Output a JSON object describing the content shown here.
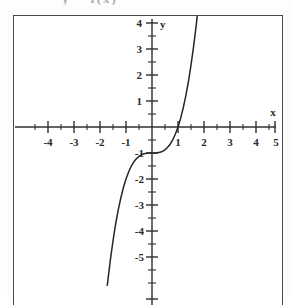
{
  "caption": {
    "fragment_text": "y = f(x)"
  },
  "chart_data": {
    "type": "line",
    "title": "",
    "subtitle": "",
    "xlabel": "x",
    "ylabel": "y",
    "function_label": "y = x^3 - 1",
    "xlim": [
      -5,
      5
    ],
    "ylim": [
      -6,
      4.3
    ],
    "grid": false,
    "legend": "none",
    "axis_style": "centered-cross",
    "x_tick_labels": [
      "-4",
      "-3",
      "-2",
      "-1",
      "1",
      "2",
      "3",
      "4",
      "5"
    ],
    "x_tick_values": [
      -4,
      -3,
      -2,
      -1,
      1,
      2,
      3,
      4,
      5
    ],
    "y_tick_labels": [
      "4",
      "3",
      "2",
      "1",
      "-1",
      "-2",
      "-3",
      "-4",
      "-5"
    ],
    "y_tick_values": [
      4,
      3,
      2,
      1,
      -1,
      -2,
      -3,
      -4,
      -5
    ],
    "minor_tick_step": 0.5,
    "series": [
      {
        "name": "y = x^3 - 1",
        "x": [
          -1.72,
          -1.6,
          -1.5,
          -1.4,
          -1.3,
          -1.2,
          -1.1,
          -1.0,
          -0.9,
          -0.8,
          -0.7,
          -0.6,
          -0.5,
          -0.4,
          -0.3,
          -0.2,
          -0.1,
          0.0,
          0.1,
          0.2,
          0.3,
          0.4,
          0.5,
          0.6,
          0.7,
          0.8,
          0.9,
          1.0,
          1.1,
          1.2,
          1.3,
          1.4,
          1.5,
          1.6,
          1.7,
          1.74
        ],
        "y": [
          -6.09,
          -5.1,
          -4.38,
          -3.74,
          -3.2,
          -2.73,
          -2.33,
          -2.0,
          -1.73,
          -1.51,
          -1.34,
          -1.22,
          -1.13,
          -1.06,
          -1.03,
          -1.01,
          -1.0,
          -1.0,
          -1.0,
          -0.99,
          -0.97,
          -0.94,
          -0.88,
          -0.78,
          -0.66,
          -0.49,
          -0.27,
          0.0,
          0.33,
          0.73,
          1.2,
          1.74,
          2.38,
          3.1,
          3.91,
          4.27
        ]
      }
    ],
    "annotations": {
      "x_intercept": 1,
      "y_intercept": -1,
      "inflection_point": [
        0,
        -1
      ]
    },
    "colors": {
      "curve": "#262626",
      "axis": "#2f2f2f",
      "frame": "#4a4a4a",
      "background": "#ffffff",
      "label": "#2b2b2b"
    }
  }
}
